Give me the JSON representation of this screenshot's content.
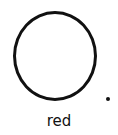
{
  "shape": {
    "type": "circle-outline",
    "color": "#111111"
  },
  "dot": {
    "color": "#111111"
  },
  "label": "red"
}
